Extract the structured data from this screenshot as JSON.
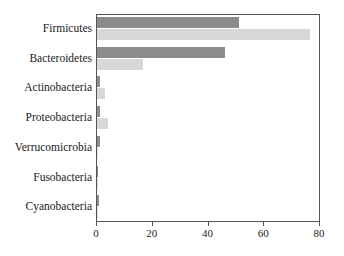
{
  "chart_data": {
    "type": "bar",
    "orientation": "horizontal",
    "title": "",
    "subtitle": "",
    "xlabel": "",
    "ylabel": "",
    "xlim": [
      0,
      80
    ],
    "xticks": [
      0,
      20,
      40,
      60,
      80
    ],
    "xtick_labels": [
      "0",
      "20",
      "40",
      "60",
      "80"
    ],
    "grid": false,
    "legend": "none",
    "categories": [
      "Firmicutes",
      "Bacteroidetes",
      "Actinobacteria",
      "Proteobacteria",
      "Verrucomicrobia",
      "Fusobacteria",
      "Cyanobacteria"
    ],
    "series": [
      {
        "name": "series-a",
        "color": "#8c8c8c",
        "values": [
          51.0,
          46.0,
          1.0,
          1.0,
          1.0,
          0.5,
          0.7
        ]
      },
      {
        "name": "series-b",
        "color": "#d8d8d8",
        "values": [
          76.5,
          16.5,
          3.0,
          4.0,
          0.4,
          0.3,
          0.2
        ]
      }
    ]
  },
  "style": {
    "axis_color": "#555555",
    "text_color": "#1a1a1a",
    "background": "#ffffff"
  }
}
